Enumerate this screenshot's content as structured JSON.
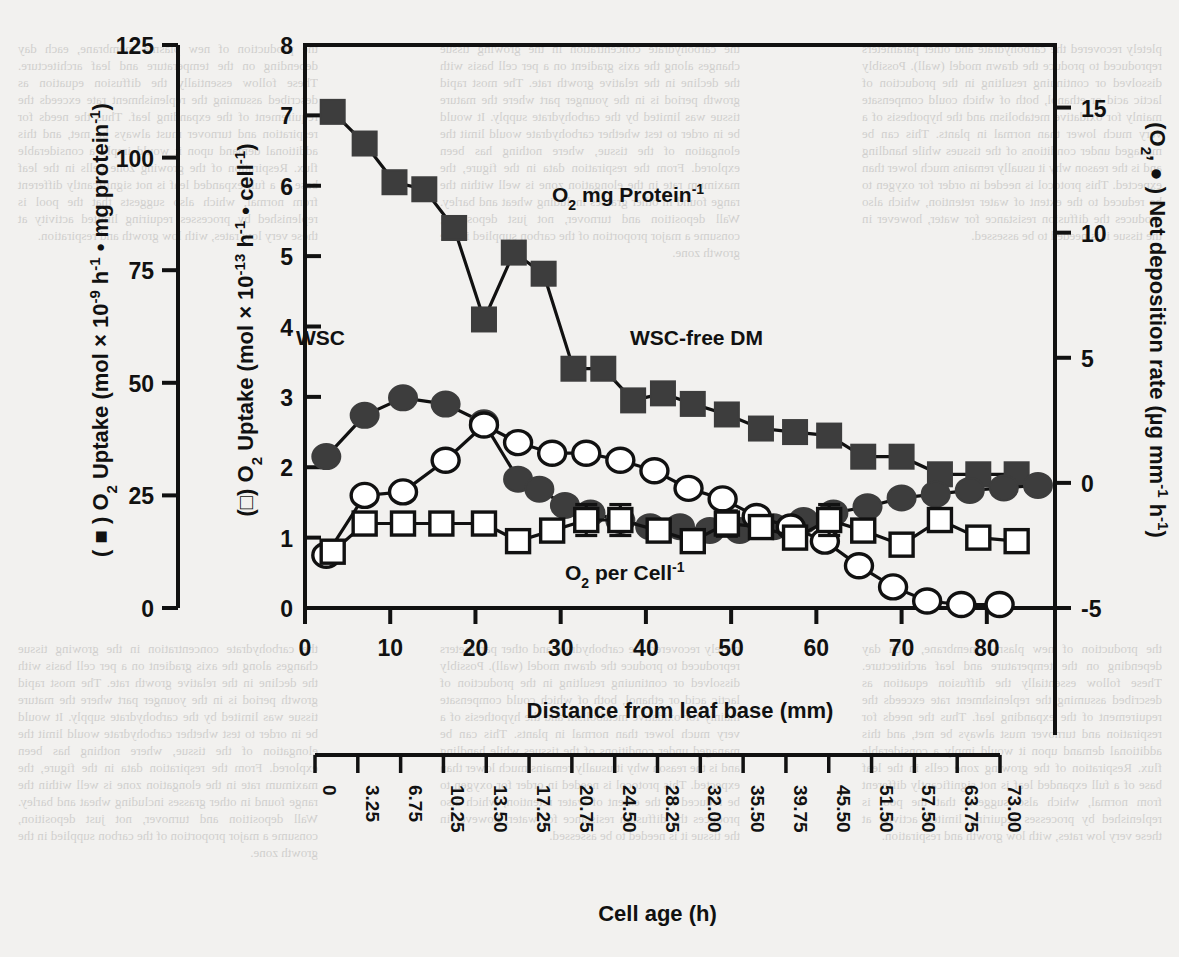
{
  "figure": {
    "left_axis_title_prefix": "( ",
    "left_axis_title": ") O2 Uptake (mol × 10-9 h-1 • mg protein-1)",
    "inner_left_axis_title": ") O2 Uptake (mol × 10-13 h-1 • cell-1)",
    "right_axis_title": ") Net deposition rate (µg mm-1 h-1)",
    "right_axis_prefix": "(O2, ",
    "xaxis_title": "Distance from leaf base (mm)",
    "xaxis2_title": "Cell age (h)",
    "series_labels": {
      "filled_square": "O2 mg Protein-1",
      "filled_circle_group": "WSC",
      "open_circle": "WSC-free DM",
      "open_square": "O2 per Cell-1"
    }
  },
  "chart_data": {
    "type": "line",
    "title": "",
    "xlabel": "Distance from leaf base (mm)",
    "xlabel_secondary": "Cell age (h)",
    "xlim": [
      0,
      88
    ],
    "xticks": [
      0,
      10,
      20,
      30,
      40,
      50,
      60,
      70,
      80
    ],
    "xticklabels": [
      "0",
      "10",
      "20",
      "30",
      "40",
      "50",
      "60",
      "70",
      "80"
    ],
    "secondary_xticklabels": [
      "0",
      "3.25",
      "6.75",
      "10.25",
      "13.50",
      "17.25",
      "20.75",
      "24.50",
      "28.25",
      "32.00",
      "35.50",
      "39.75",
      "45.50",
      "51.50",
      "57.50",
      "63.75",
      "73.00"
    ],
    "axes": [
      {
        "id": "outer-left",
        "label": "( ■ ) O2 Uptake (mol × 10-9 h-1 • mg protein-1)",
        "ylim": [
          0,
          125
        ],
        "yticks": [
          0,
          25,
          50,
          75,
          100,
          125
        ],
        "yticklabels": [
          "0",
          "25",
          "50",
          "75",
          "100",
          "125"
        ]
      },
      {
        "id": "inner-left",
        "label": "( □ ) O2 Uptake (mol × 10-13 h-1 • cell-1)",
        "ylim": [
          0,
          8
        ],
        "yticks": [
          0,
          1,
          2,
          3,
          4,
          5,
          6,
          7,
          8
        ],
        "yticklabels": [
          "0",
          "1",
          "2",
          "3",
          "4",
          "5",
          "6",
          "7",
          "8"
        ]
      },
      {
        "id": "right",
        "label": "(O2, ● ) Net deposition rate (µg mm-1 h-1)",
        "ylim": [
          -5,
          17.5
        ],
        "yticks": [
          -5,
          0,
          5,
          10,
          15
        ],
        "yticklabels": [
          "-5",
          "0",
          "5",
          "10",
          "15"
        ]
      }
    ],
    "grid": false,
    "legend_position": "inline-annotations",
    "series": [
      {
        "name": "O2 mg Protein-1",
        "marker": "filled-square",
        "axis": "inner-left",
        "color": "#3d3d3d",
        "x": [
          3.25,
          7.0,
          10.5,
          14.0,
          17.5,
          21.0,
          24.5,
          28.0,
          31.5,
          35.0,
          38.5,
          42.0,
          45.5,
          49.5,
          53.5,
          57.5,
          61.5,
          65.5,
          70.0,
          74.5,
          79.0,
          83.5
        ],
        "values": [
          7.05,
          6.6,
          6.05,
          5.95,
          5.4,
          4.1,
          5.05,
          4.75,
          3.4,
          3.4,
          2.95,
          3.05,
          2.9,
          2.75,
          2.55,
          2.5,
          2.45,
          2.15,
          2.15,
          1.9,
          1.9,
          1.9
        ]
      },
      {
        "name": "WSC",
        "marker": "filled-circle",
        "axis": "right",
        "color": "#3d3d3d",
        "x": [
          2.5,
          7.0,
          11.5,
          16.5,
          21.0,
          25.0,
          27.5,
          30.5,
          33.5,
          37.0,
          40.5,
          44.0,
          47.5,
          51.0,
          55.0,
          58.5,
          62.0,
          66.0,
          70.0,
          74.0,
          78.0,
          82.0,
          86.0
        ],
        "values": [
          1.05,
          2.7,
          3.4,
          3.15,
          2.4,
          0.15,
          -0.25,
          -0.9,
          -1.2,
          -1.5,
          -1.75,
          -1.75,
          -1.9,
          -1.9,
          -1.75,
          -1.5,
          -1.2,
          -0.95,
          -0.6,
          -0.45,
          -0.3,
          -0.2,
          -0.1
        ]
      },
      {
        "name": "WSC-free DM",
        "marker": "open-circle",
        "axis": "inner-left",
        "color": "#ffffff",
        "x": [
          2.5,
          7.0,
          11.5,
          16.5,
          21.0,
          25.0,
          29.0,
          33.0,
          37.0,
          41.0,
          45.0,
          49.0,
          53.0,
          57.0,
          61.0,
          65.0,
          69.0,
          73.0,
          77.0,
          81.5
        ],
        "values": [
          0.75,
          1.6,
          1.65,
          2.1,
          2.6,
          2.35,
          2.2,
          2.2,
          2.1,
          1.95,
          1.7,
          1.55,
          1.3,
          1.15,
          0.95,
          0.6,
          0.3,
          0.1,
          0.05,
          0.05
        ]
      },
      {
        "name": "O2 per Cell-1",
        "marker": "open-square",
        "axis": "inner-left",
        "color": "#ffffff",
        "x": [
          3.25,
          7.0,
          11.5,
          16.0,
          21.0,
          25.0,
          29.0,
          33.0,
          37.0,
          41.5,
          45.5,
          49.5,
          53.5,
          57.5,
          61.5,
          65.5,
          70.0,
          74.5,
          79.0,
          83.5
        ],
        "values": [
          0.8,
          1.2,
          1.2,
          1.2,
          1.2,
          0.95,
          1.1,
          1.25,
          1.25,
          1.1,
          0.95,
          1.2,
          1.15,
          1.0,
          1.25,
          1.1,
          0.9,
          1.25,
          1.0,
          0.95
        ],
        "errors": [
          0,
          0,
          0,
          0,
          0,
          0,
          0,
          0.22,
          0.22,
          0,
          0,
          0.18,
          0,
          0,
          0.22,
          0,
          0,
          0,
          0,
          0
        ]
      }
    ]
  },
  "background_text": {
    "left_col": "the production of new plasma membrane, each day depending on the temperature and leaf architecture. These follow essentially the diffusion equation as described assuming the replenishment rate exceeds the requirement of the expanding leaf. Thus the needs for respiration and turnover must always be met, and this additional demand upon it would imply a considerable flux. Respiration of the growing zone cells in the leaf base of a full expanded leaf is not significantly different from normal, which also suggests that the pool is replenished by processes requiring limited activity at these very low rates, with low growth and respiration.",
    "mid_col": "the carbohydrate concentration in the growing tissue changes along the axis gradient on a per cell basis with the decline in the relative growth rate. The most rapid growth period is in the younger part where the mature tissue was limited by the carbohydrate supply. It would be in order to test whether carbohydrate would limit the elongation of the tissue, where nothing has been explored. From the respiration data in the figure, the maximum rate in the elongation zone is well within the range found in other grasses including wheat and barley. Wall deposition and turnover, not just deposition, consume a major proportion of the carbon supplied in the growth zone.",
    "right_col": "pletely recovered the carbohydrate and other parameters reproduced to produce the drawn model (wall). Possibly dissolved or continuing resulting in the production of lactic acid or ethanol, both of which could compensate mainly for oxidative metabolism and the hypothesis of a very much lower than normal in plants. This can be managed under conditions of the tissues while handling and is the reason why it usually remains much lower than expected. This protocol is needed in order for oxygen to be reduced to the extent of water retention, which also produces the diffusion resistance for water, however in the tissue it is needed to be assessed."
  }
}
